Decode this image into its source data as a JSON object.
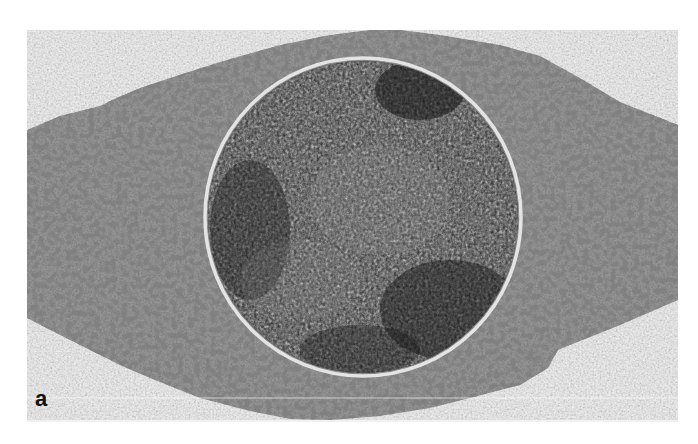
{
  "figure": {
    "type": "micrograph",
    "panel_label": "a",
    "colors": {
      "page_background": "#ffffff",
      "photo_background": "#f1f1f1",
      "cytoplasm": "#9a9a9a",
      "nucleus": "#3a3a3a",
      "nuclear_envelope": "#e6e6e6",
      "label": "#111111"
    },
    "photo_bounds": {
      "x": 27,
      "y": 30,
      "width": 651,
      "height": 392
    },
    "nucleus": {
      "cx": 363,
      "cy": 217,
      "rx": 157,
      "ry": 158
    }
  }
}
